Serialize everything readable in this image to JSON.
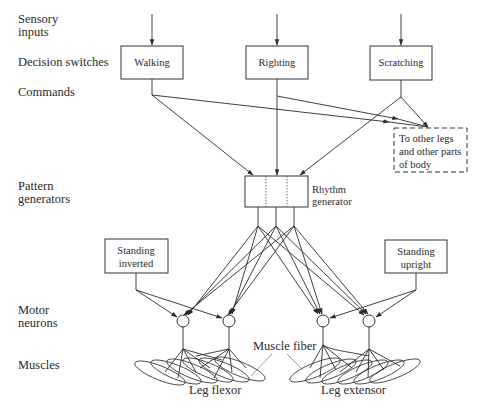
{
  "figure": {
    "type": "neural-control-hierarchy",
    "level_labels": [
      {
        "id": "sensory",
        "lines": [
          "Sensory",
          "inputs"
        ]
      },
      {
        "id": "decision",
        "lines": [
          "Decision switches"
        ]
      },
      {
        "id": "commands",
        "lines": [
          "Commands"
        ]
      },
      {
        "id": "pattern",
        "lines": [
          "Pattern",
          "generators"
        ]
      },
      {
        "id": "motor",
        "lines": [
          "Motor",
          "neurons"
        ]
      },
      {
        "id": "muscles",
        "lines": [
          "Muscles"
        ]
      }
    ],
    "decision_boxes": [
      {
        "id": "walking",
        "label": "Walking"
      },
      {
        "id": "righting",
        "label": "Righting"
      },
      {
        "id": "scratching",
        "label": "Scratching"
      }
    ],
    "other_body": {
      "lines": [
        "To other legs",
        "and other parts",
        "of body"
      ]
    },
    "rhythm_generator": {
      "lines": [
        "Rhythm",
        "generator"
      ]
    },
    "standing_inverted": {
      "lines": [
        "Standing",
        "inverted"
      ]
    },
    "standing_upright": {
      "lines": [
        "Standing",
        "upright"
      ]
    },
    "muscle_fiber_label": "Muscle fiber",
    "leg_flexor_label": "Leg flexor",
    "leg_extensor_label": "Leg extensor"
  }
}
